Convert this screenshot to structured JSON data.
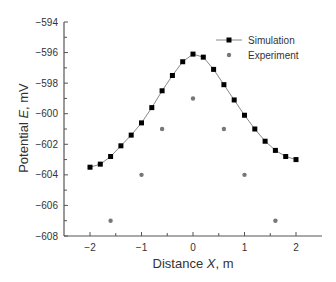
{
  "chart_data": {
    "type": "line",
    "title": "",
    "xlabel": "Distance X, m",
    "xlabel_parts": [
      "Distance ",
      "X",
      ", m"
    ],
    "ylabel": "Potential E, mV",
    "ylabel_parts": [
      "Potential ",
      "E",
      ", mV"
    ],
    "xlim": [
      -2.5,
      2.5
    ],
    "ylim": [
      -608,
      -594
    ],
    "x_ticks": [
      -2,
      -1,
      0,
      1,
      2
    ],
    "x_tick_labels": [
      "−2",
      "−1",
      "0",
      "1",
      "2"
    ],
    "y_ticks": [
      -594,
      -596,
      -598,
      -600,
      -602,
      -604,
      -606,
      -608
    ],
    "y_tick_labels": [
      "−594",
      "−596",
      "−598",
      "−600",
      "−602",
      "−604",
      "−606",
      "−608"
    ],
    "grid": false,
    "legend_position": "upper right",
    "series": [
      {
        "name": "Simulation",
        "style": "line+square",
        "color": "#000000",
        "line_color": "#888888",
        "x": [
          -2.0,
          -1.8,
          -1.6,
          -1.4,
          -1.2,
          -1.0,
          -0.8,
          -0.6,
          -0.4,
          -0.2,
          0.0,
          0.2,
          0.4,
          0.6,
          0.8,
          1.0,
          1.2,
          1.4,
          1.6,
          1.8,
          2.0
        ],
        "y": [
          -603.5,
          -603.3,
          -602.8,
          -602.1,
          -601.4,
          -600.6,
          -599.6,
          -598.5,
          -597.5,
          -596.6,
          -596.1,
          -596.3,
          -597.1,
          -598.1,
          -599.1,
          -600.1,
          -601.0,
          -601.8,
          -602.4,
          -602.8,
          -603.0
        ]
      },
      {
        "name": "Experiment",
        "style": "scatter-circle",
        "color": "#777777",
        "x": [
          -1.6,
          -1.0,
          -0.6,
          0.0,
          0.6,
          1.0,
          1.6
        ],
        "y": [
          -607.0,
          -604.0,
          -601.0,
          -599.0,
          -601.0,
          -604.0,
          -607.0
        ]
      }
    ]
  }
}
